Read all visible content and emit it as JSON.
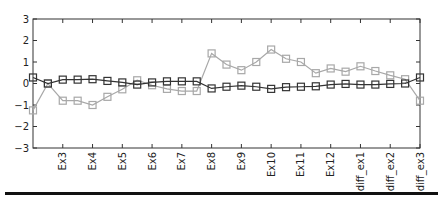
{
  "chart_data": {
    "type": "line",
    "title": "",
    "xlabel": "",
    "ylabel": "",
    "ylim": [
      -3,
      3
    ],
    "yticks": [
      3,
      2,
      1,
      0,
      -1,
      -2,
      -3
    ],
    "grid": false,
    "legend": null,
    "tick_labels": [
      "Ex3",
      "Ex4",
      "Ex5",
      "Ex6",
      "Ex7",
      "Ex8",
      "Ex9",
      "Ex10",
      "Ex11",
      "Ex12",
      "diff_ex1",
      "diff_ex2",
      "diff_ex3"
    ],
    "x": [
      0,
      0.5,
      1,
      1.5,
      2,
      2.5,
      3,
      3.5,
      4,
      4.5,
      5,
      5.5,
      6,
      6.5,
      7,
      7.5,
      8,
      8.5,
      9,
      9.5,
      10,
      10.5,
      11,
      11.5,
      12,
      12.5,
      13
    ],
    "series": [
      {
        "name": "dark",
        "color": "#333333",
        "marker": "square",
        "values": [
          0.28,
          0.0,
          0.18,
          0.18,
          0.2,
          0.12,
          0.05,
          -0.05,
          0.05,
          0.1,
          0.1,
          0.1,
          -0.23,
          -0.15,
          -0.1,
          -0.15,
          -0.25,
          -0.17,
          -0.15,
          -0.13,
          -0.05,
          -0.02,
          -0.05,
          -0.05,
          -0.02,
          0.0,
          0.28
        ]
      },
      {
        "name": "light",
        "color": "#a8a8a8",
        "marker": "square",
        "values": [
          -1.25,
          0.0,
          -0.8,
          -0.8,
          -1.0,
          -0.62,
          -0.27,
          0.15,
          -0.08,
          -0.25,
          -0.35,
          -0.35,
          1.4,
          0.88,
          0.62,
          1.0,
          1.58,
          1.15,
          1.0,
          0.48,
          0.7,
          0.55,
          0.8,
          0.58,
          0.38,
          0.2,
          -0.8
        ]
      }
    ]
  },
  "axes": {
    "ytick_labels": [
      "3",
      "2",
      "1",
      "0",
      "−1",
      "−2",
      "−3"
    ]
  }
}
